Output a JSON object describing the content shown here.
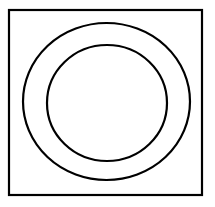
{
  "diagram": {
    "background_color": "#ffffff",
    "stroke_color": "#000000",
    "square": {
      "x": 9,
      "y": 10,
      "width": 193,
      "height": 185,
      "stroke_width": 2.2
    },
    "outer_circle": {
      "cx": 106.5,
      "cy": 101.5,
      "rx": 83.5,
      "ry": 78.5,
      "stroke_width": 2.2
    },
    "inner_circle": {
      "cx": 107,
      "cy": 103,
      "rx": 60,
      "ry": 58,
      "stroke_width": 2.2
    }
  }
}
